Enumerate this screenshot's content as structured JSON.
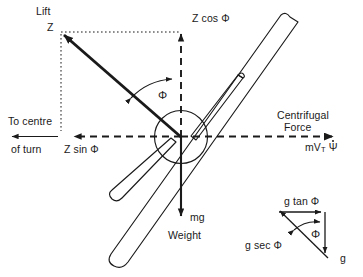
{
  "figure": {
    "width": 363,
    "height": 277,
    "background": "#ffffff",
    "stroke": "#1a1a1a"
  },
  "labels": {
    "lift": "Lift",
    "lift_symbol": "Z",
    "z_cos_phi": "Z cos Φ",
    "z_sin_phi": "Z sin Φ",
    "to_centre_line1": "To centre",
    "to_centre_line2": "of  turn",
    "centrifugal_line1": "Centrifugal",
    "centrifugal_line2": "Force",
    "centrifugal_symbol_m": "mV",
    "centrifugal_symbol_sub": "T",
    "centrifugal_symbol_psi": "Ψ",
    "bank_angle": "Φ",
    "mg": "mg",
    "weight": "Weight"
  },
  "inset": {
    "g_tan_phi": "g tan Φ",
    "g_sec_phi": "g sec Φ",
    "g": "g",
    "phi": "Φ"
  },
  "colors": {
    "line": "#1a1a1a",
    "text": "#1a1a1a",
    "background": "#ffffff"
  }
}
